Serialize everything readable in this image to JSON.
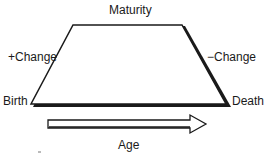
{
  "diagram": {
    "type": "lifecycle-trapezoid",
    "labels": {
      "top": "Maturity",
      "left_side": "+Change",
      "right_side": "−Change",
      "bottom_left": "Birth",
      "bottom_right": "Death",
      "axis": "Age"
    },
    "colors": {
      "stroke": "#1a1a1a",
      "fill": "#ffffff",
      "background": "#ffffff"
    }
  }
}
